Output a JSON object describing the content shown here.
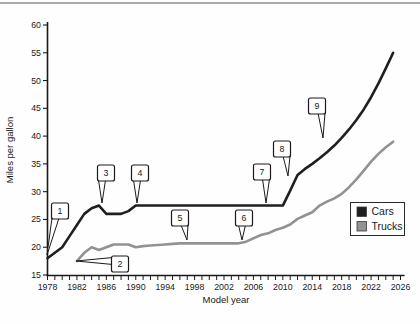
{
  "page": {
    "background": "#fefefe",
    "top_rule_color": "#ababab"
  },
  "chart_data": {
    "type": "line",
    "title": "",
    "xlabel": "Model year",
    "ylabel": "Miles per gallon",
    "xlim": [
      1978,
      2026
    ],
    "ylim": [
      15,
      60
    ],
    "grid": false,
    "x_minor_tick_step": 1,
    "x_ticks_labeled": [
      1978,
      1982,
      1986,
      1990,
      1994,
      1998,
      2002,
      2006,
      2010,
      2014,
      2018,
      2022,
      2026
    ],
    "y_ticks": [
      15,
      20,
      25,
      30,
      35,
      40,
      45,
      50,
      55,
      60
    ],
    "axis_color": "#1a1a1a",
    "legend": {
      "position": "right-middle",
      "border_color": "#2a2a2a",
      "entries": [
        {
          "label": "Cars",
          "color": "#1f1f1f"
        },
        {
          "label": "Trucks",
          "color": "#909294"
        }
      ]
    },
    "series": [
      {
        "name": "Cars",
        "color": "#1f1f1f",
        "points": [
          [
            1978,
            18
          ],
          [
            1979,
            19
          ],
          [
            1980,
            20
          ],
          [
            1981,
            22
          ],
          [
            1982,
            24
          ],
          [
            1983,
            26
          ],
          [
            1984,
            27
          ],
          [
            1985,
            27.5
          ],
          [
            1986,
            26
          ],
          [
            1987,
            26
          ],
          [
            1988,
            26
          ],
          [
            1989,
            26.5
          ],
          [
            1990,
            27.5
          ],
          [
            2010,
            27.5
          ],
          [
            2011,
            30.2
          ],
          [
            2012,
            33
          ],
          [
            2013,
            34.1
          ],
          [
            2014,
            35
          ],
          [
            2015,
            36
          ],
          [
            2016,
            37.1
          ],
          [
            2017,
            38.3
          ],
          [
            2018,
            39.7
          ],
          [
            2019,
            41.2
          ],
          [
            2020,
            42.9
          ],
          [
            2021,
            44.8
          ],
          [
            2022,
            47
          ],
          [
            2023,
            49.5
          ],
          [
            2024,
            52.2
          ],
          [
            2025,
            55
          ]
        ]
      },
      {
        "name": "Trucks",
        "color": "#909294",
        "points": [
          [
            1982,
            17.5
          ],
          [
            1983,
            19
          ],
          [
            1984,
            20
          ],
          [
            1985,
            19.5
          ],
          [
            1986,
            20
          ],
          [
            1987,
            20.5
          ],
          [
            1988,
            20.5
          ],
          [
            1989,
            20.5
          ],
          [
            1990,
            20
          ],
          [
            1991,
            20.2
          ],
          [
            1992,
            20.3
          ],
          [
            1993,
            20.4
          ],
          [
            1994,
            20.5
          ],
          [
            1995,
            20.6
          ],
          [
            1996,
            20.7
          ],
          [
            2004,
            20.7
          ],
          [
            2005,
            21
          ],
          [
            2006,
            21.6
          ],
          [
            2007,
            22.2
          ],
          [
            2008,
            22.5
          ],
          [
            2009,
            23.1
          ],
          [
            2010,
            23.5
          ],
          [
            2011,
            24.1
          ],
          [
            2012,
            25.1
          ],
          [
            2013,
            25.7
          ],
          [
            2014,
            26.3
          ],
          [
            2015,
            27.5
          ],
          [
            2016,
            28.2
          ],
          [
            2017,
            28.8
          ],
          [
            2018,
            29.6
          ],
          [
            2019,
            30.8
          ],
          [
            2020,
            32.2
          ],
          [
            2021,
            33.8
          ],
          [
            2022,
            35.4
          ],
          [
            2023,
            36.8
          ],
          [
            2024,
            38
          ],
          [
            2025,
            39
          ]
        ]
      }
    ],
    "callouts": [
      {
        "label": "1",
        "box": [
          60,
          211
        ],
        "apex": [
          47,
          255
        ],
        "side": "bottom"
      },
      {
        "label": "2",
        "box": [
          120,
          264
        ],
        "apex": [
          76,
          261
        ],
        "side": "left"
      },
      {
        "label": "3",
        "box": [
          106,
          173
        ],
        "apex": [
          102,
          203
        ],
        "side": "bottom"
      },
      {
        "label": "4",
        "box": [
          140,
          173
        ],
        "apex": [
          137,
          203
        ],
        "side": "bottom"
      },
      {
        "label": "5",
        "box": [
          180,
          218
        ],
        "apex": [
          187,
          240
        ],
        "side": "bottom"
      },
      {
        "label": "6",
        "box": [
          244,
          218
        ],
        "apex": [
          242,
          240
        ],
        "side": "bottom"
      },
      {
        "label": "7",
        "box": [
          262,
          172
        ],
        "apex": [
          266,
          203
        ],
        "side": "bottom"
      },
      {
        "label": "8",
        "box": [
          282,
          149
        ],
        "apex": [
          288,
          176
        ],
        "side": "bottom"
      },
      {
        "label": "9",
        "box": [
          317,
          106
        ],
        "apex": [
          323,
          138
        ],
        "side": "bottom"
      }
    ]
  }
}
